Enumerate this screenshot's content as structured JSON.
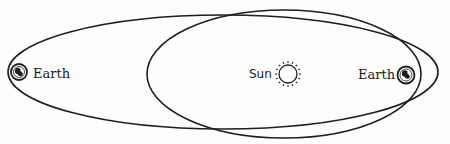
{
  "diagram": {
    "colors": {
      "line": "#1e1e1e",
      "background": "#fdfdfc",
      "earth_fill": "#1e1e1e"
    },
    "labels": {
      "earth_left": "Earth",
      "sun": "Sun",
      "earth_right": "Earth"
    },
    "orbits": [
      {
        "name": "large-orbit",
        "cx": 223,
        "cy": 72,
        "rx": 215,
        "ry": 57
      },
      {
        "name": "small-orbit",
        "cx": 284,
        "cy": 74,
        "rx": 137,
        "ry": 64
      }
    ],
    "bodies": [
      {
        "name": "earth-left",
        "cx": 19,
        "cy": 72,
        "r": 8
      },
      {
        "name": "sun",
        "cx": 288,
        "cy": 74,
        "r": 9
      },
      {
        "name": "earth-right",
        "cx": 406,
        "cy": 75,
        "r": 8.5
      }
    ]
  }
}
